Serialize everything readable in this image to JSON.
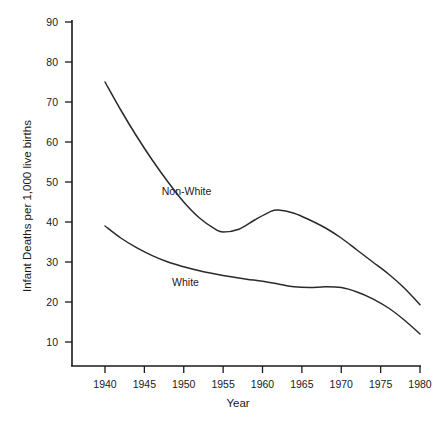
{
  "chart_data": {
    "type": "line",
    "title": "",
    "xlabel": "Year",
    "ylabel": "Infant Deaths per 1,000 live births",
    "xlim": [
      1938,
      1981
    ],
    "ylim": [
      5,
      92
    ],
    "xticks": [
      1940,
      1945,
      1950,
      1955,
      1960,
      1965,
      1970,
      1975,
      1980
    ],
    "yticks": [
      10,
      20,
      30,
      40,
      50,
      60,
      70,
      80,
      90
    ],
    "grid": false,
    "legend_position": "inline-annotations",
    "line_color": "#2a2a2a",
    "series": [
      {
        "name": "Non-White",
        "label_x": 1950.0,
        "label_y": 47.5,
        "x": [
          1940,
          1942,
          1944,
          1946,
          1948,
          1950,
          1952,
          1954,
          1955,
          1957,
          1959,
          1961,
          1962,
          1964,
          1966,
          1968,
          1970,
          1972,
          1974,
          1976,
          1978,
          1980
        ],
        "values": [
          75.0,
          68.0,
          61.5,
          55.5,
          50.0,
          45.0,
          41.0,
          38.2,
          37.5,
          38.2,
          40.5,
          42.6,
          43.0,
          42.2,
          40.5,
          38.5,
          36.0,
          33.0,
          30.0,
          27.0,
          23.5,
          19.3
        ]
      },
      {
        "name": "White",
        "label_x": 1950.3,
        "label_y": 24.8,
        "x": [
          1940,
          1942,
          1944,
          1946,
          1948,
          1950,
          1952,
          1954,
          1956,
          1958,
          1960,
          1962,
          1964,
          1966,
          1968,
          1970,
          1972,
          1974,
          1976,
          1978,
          1980
        ],
        "values": [
          39.0,
          36.0,
          33.6,
          31.6,
          30.0,
          28.8,
          27.8,
          27.0,
          26.3,
          25.7,
          25.2,
          24.5,
          23.8,
          23.6,
          23.8,
          23.6,
          22.5,
          20.8,
          18.5,
          15.5,
          12.0
        ]
      }
    ]
  },
  "axis": {
    "x_title": "Year",
    "y_title": "Infant Deaths per 1,000 live births",
    "x_tick_labels": [
      "1940",
      "1945",
      "1950",
      "1955",
      "1960",
      "1965",
      "1970",
      "1975",
      "1980"
    ],
    "y_tick_labels": [
      "90",
      "80",
      "70",
      "60",
      "50",
      "40",
      "30",
      "20",
      "10"
    ]
  },
  "annotations": {
    "non_white_label": "Non-White",
    "white_label": "White"
  }
}
